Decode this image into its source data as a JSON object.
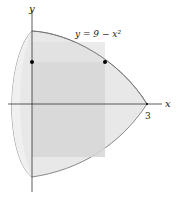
{
  "figure": {
    "curve_label": "y = 9 − x²",
    "x_axis_label": "x",
    "y_axis_label": "y",
    "x_tick_label": "3",
    "colors": {
      "solid_fill": "#e6e6e6",
      "inner_fill": "#d2d2d2",
      "outline": "#6e6e6e",
      "axis": "#333333",
      "point": "#000000"
    }
  }
}
